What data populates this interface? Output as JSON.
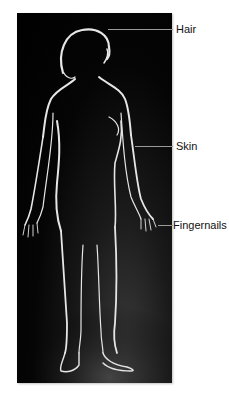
{
  "figure": {
    "labels": [
      {
        "id": "hair",
        "text": "Hair"
      },
      {
        "id": "skin",
        "text": "Skin"
      },
      {
        "id": "fingernails",
        "text": "Fingernails"
      }
    ]
  },
  "colors": {
    "photo_background": "#000000",
    "rim_light": "#e8e8e8",
    "leader_line": "#9a9a9a",
    "label_text": "#111111",
    "page_background": "#ffffff"
  }
}
